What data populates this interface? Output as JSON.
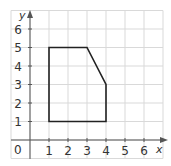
{
  "chart_data": {
    "type": "scatter",
    "title": "",
    "xlabel": "x",
    "ylabel": "y",
    "xlim": [
      -1,
      7
    ],
    "ylim": [
      -1,
      7
    ],
    "grid": true,
    "x_ticks": [
      "1",
      "2",
      "3",
      "4",
      "5",
      "6"
    ],
    "y_ticks": [
      "1",
      "2",
      "3",
      "4",
      "5",
      "6"
    ],
    "origin_label": "0",
    "series": [
      {
        "name": "polygon",
        "closed": true,
        "points": [
          [
            1,
            1
          ],
          [
            1,
            5
          ],
          [
            3,
            5
          ],
          [
            4,
            3
          ],
          [
            4,
            1
          ]
        ]
      }
    ]
  },
  "colors": {
    "grid": "#d9d9d9",
    "axis": "#555555",
    "polygon": "#222222",
    "text": "#333333"
  }
}
